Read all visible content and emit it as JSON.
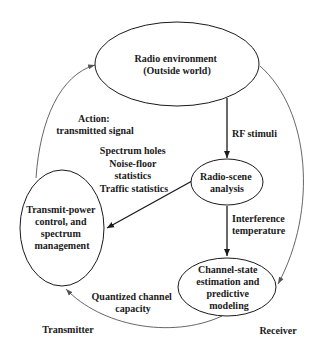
{
  "diagram": {
    "nodes": {
      "radio_environment": {
        "lines": [
          "Radio environment",
          "(Outside world)"
        ]
      },
      "radio_scene_analysis": {
        "lines": [
          "Radio-scene",
          "analysis"
        ]
      },
      "transmit_power_control": {
        "lines": [
          "Transmit-power",
          "control, and",
          "spectrum",
          "management"
        ]
      },
      "channel_state_estimation": {
        "lines": [
          "Channel-state",
          "estimation and",
          "predictive",
          "modeling"
        ]
      }
    },
    "edges": {
      "action": {
        "lines": [
          "Action:",
          "transmitted signal"
        ]
      },
      "rf_stimuli": {
        "lines": [
          "RF stimuli"
        ]
      },
      "spectrum_info": {
        "lines": [
          "Spectrum holes",
          "Noise-floor",
          "statistics",
          "Traffic statistics"
        ]
      },
      "interference": {
        "lines": [
          "Interference",
          "temperature"
        ]
      },
      "quantized": {
        "lines": [
          "Quantized channel",
          "capacity"
        ]
      }
    },
    "labels": {
      "transmitter": "Transmitter",
      "receiver": "Receiver"
    },
    "colors": {
      "stroke": "#1a1a1a",
      "thin_stroke": "#555555",
      "background": "#ffffff"
    }
  }
}
